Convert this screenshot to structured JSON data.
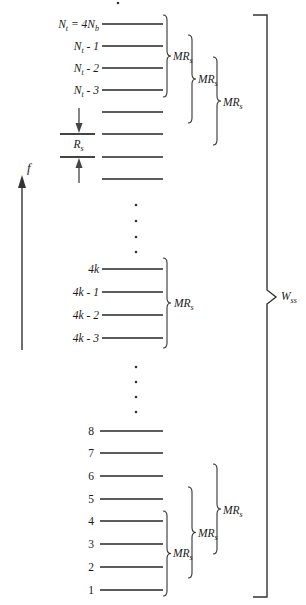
{
  "figure": {
    "frequency_axis_label": "f",
    "tone_spacing_label": "R_{s}",
    "band_size_label": "MR_{s}",
    "total_bandwidth_label": "W_{ss}",
    "top_tones": [
      "N_{t} = 4N_{b}",
      "N_{t} - 1",
      "N_{t} - 2",
      "N_{t} - 3",
      "",
      "",
      "",
      ""
    ],
    "middle_tones": [
      "4k",
      "4k - 1",
      "4k - 2",
      "4k - 3"
    ],
    "bottom_tones": [
      "8",
      "7",
      "6",
      "5",
      "4",
      "3",
      "2",
      "1"
    ]
  }
}
